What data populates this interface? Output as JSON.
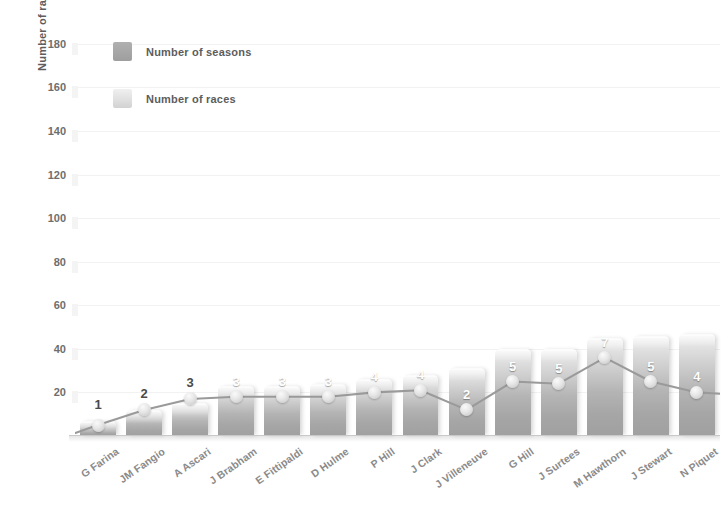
{
  "chart_data": {
    "type": "bar",
    "title": "",
    "xlabel": "",
    "ylabel": "Number of races",
    "ylim": [
      0,
      190
    ],
    "ytick_values": [
      20,
      40,
      60,
      80,
      100,
      120,
      140,
      160,
      180
    ],
    "ytick_labels": [
      "20",
      "40",
      "60",
      "80",
      "100",
      "120",
      "140",
      "160",
      "180"
    ],
    "grid": true,
    "legend_position": "top-left",
    "categories": [
      "G Farina",
      "JM Fangio",
      "A Ascari",
      "J Brabham",
      "E Fittipaldi",
      "D Hulme",
      "P Hill",
      "J Clark",
      "J Villeneuve",
      "G Hill",
      "J Surtees",
      "M Hawthorn",
      "J Stewart",
      "N Piquet"
    ],
    "series": [
      {
        "name": "Number of races",
        "render": "bar",
        "axis": "left",
        "values": [
          7,
          12,
          15,
          23,
          23,
          24,
          26,
          28,
          31,
          40,
          40,
          45,
          46,
          47
        ]
      },
      {
        "name": "Number of seasons",
        "render": "line",
        "axis": "left_scaled",
        "point_labels": [
          "1",
          "2",
          "3",
          "3",
          "3",
          "3",
          "4",
          "4",
          "2",
          "5",
          "5",
          "7",
          "5",
          "4"
        ],
        "values": [
          1,
          2,
          3,
          3,
          3,
          3,
          4,
          4,
          2,
          5,
          5,
          7,
          5,
          4
        ],
        "plot_values": [
          5,
          12,
          17,
          18,
          18,
          18,
          20,
          21,
          12,
          25,
          24,
          36,
          25,
          20
        ]
      }
    ]
  },
  "legend": {
    "items": [
      {
        "label": "Number of seasons",
        "swatch": "seasons",
        "color": "#a8a8a8"
      },
      {
        "label": "Number of races",
        "swatch": "races",
        "color": "#e0e0e0"
      }
    ]
  },
  "colors": {
    "bar_light": "#f2f2f2",
    "bar_dark": "#a0a0a0",
    "line": "#9a9a9a",
    "grid": "#f2f2f2",
    "axis_text": "#6e6e6e",
    "label_text": "#8a8a8a",
    "background": "#ffffff"
  }
}
